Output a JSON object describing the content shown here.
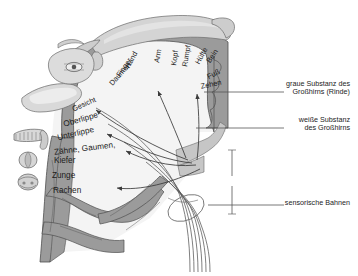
{
  "figure": {
    "language": "de",
    "background": "#ffffff"
  },
  "colors": {
    "gray_matter": "#9b9b9b",
    "gray_matter_dark": "#8a8a8a",
    "white_matter": "#f2f2f2",
    "homunculus_body": "#c9c9c9",
    "homunculus_body_light": "#d8d8d8",
    "outline": "#4a4a4a",
    "arrow": "#3a3a3a",
    "text": "#1c1c1c",
    "leader": "#555555"
  },
  "side_labels": [
    {
      "name": "gray-matter",
      "line1": "graue Substanz des",
      "line2": "Großhirns (Rinde)",
      "text_x": 286,
      "text_y": 86,
      "leader": {
        "x1": 252,
        "y1": 92,
        "x2": 284,
        "y2": 92,
        "tick_x": 204,
        "tick_y": 92
      }
    },
    {
      "name": "white-matter",
      "line1": "weiße Substanz",
      "line2": "des Großhirns",
      "text_x": 286,
      "text_y": 122,
      "leader": {
        "x1": 240,
        "y1": 128,
        "x2": 284,
        "y2": 128,
        "tick_x": 196,
        "tick_y": 128
      }
    },
    {
      "name": "sensory-tracts",
      "line1": "sensorische Bahnen",
      "line2": "",
      "text_x": 286,
      "text_y": 202,
      "leader": {
        "x1": 248,
        "y1": 205,
        "x2": 284,
        "y2": 205,
        "tick_x": 208,
        "tick_y": 205
      }
    }
  ],
  "cortex_labels": [
    {
      "name": "hand",
      "text": "Hand",
      "x": 124,
      "y": 66,
      "rot": -62
    },
    {
      "name": "finger",
      "text": "Finger",
      "x": 115,
      "y": 74,
      "rot": -55
    },
    {
      "name": "daumen",
      "text": "Daumen",
      "x": 108,
      "y": 82,
      "rot": -48
    },
    {
      "name": "gesicht",
      "text": "Gesicht",
      "x": 71,
      "y": 106,
      "rot": -22
    },
    {
      "name": "arm",
      "text": "Arm",
      "x": 153,
      "y": 62,
      "rot": -80
    },
    {
      "name": "kopf",
      "text": "Kopf",
      "x": 170,
      "y": 65,
      "rot": -82
    },
    {
      "name": "rumpf",
      "text": "Rumpf",
      "x": 181,
      "y": 66,
      "rot": -80
    },
    {
      "name": "huefte",
      "text": "Hüfte",
      "x": 194,
      "y": 62,
      "rot": -62
    },
    {
      "name": "bein",
      "text": "Bein",
      "x": 205,
      "y": 60,
      "rot": -55
    },
    {
      "name": "fuss",
      "text": "Fuß",
      "x": 206,
      "y": 74,
      "rot": -28
    },
    {
      "name": "zehen",
      "text": "Zehen",
      "x": 201,
      "y": 83,
      "rot": -12
    }
  ],
  "mouth_labels": [
    {
      "name": "oberlippe",
      "text": "Oberlippe",
      "x": 63,
      "y": 116,
      "rot": -16
    },
    {
      "name": "unterlippe",
      "text": "Unterlippe",
      "x": 58,
      "y": 130,
      "rot": -13
    },
    {
      "name": "zaehne",
      "text": "Zähne, Gaumen,",
      "x": 55,
      "y": 145,
      "rot": -7
    },
    {
      "name": "kiefer",
      "text": "Kiefer",
      "x": 55,
      "y": 156,
      "rot": 0
    },
    {
      "name": "zunge",
      "text": "Zunge",
      "x": 53,
      "y": 171,
      "rot": 0
    },
    {
      "name": "rachen",
      "text": "Rachen",
      "x": 54,
      "y": 186,
      "rot": 0
    }
  ],
  "body_icons": [
    {
      "name": "nose-lips-icon",
      "x": 30,
      "y": 103
    },
    {
      "name": "teeth-jaw-icon",
      "x": 22,
      "y": 140
    },
    {
      "name": "tongue-icon",
      "x": 22,
      "y": 162
    },
    {
      "name": "pharynx-icon",
      "x": 22,
      "y": 182
    }
  ],
  "arrows": [
    {
      "name": "arrow-to-gesicht",
      "path": "M 188 160 C 160 150 120 128 93 109",
      "tip": [
        93,
        109
      ]
    },
    {
      "name": "arrow-to-lippe",
      "path": "M 192 163 C 160 160 124 142 104 133",
      "tip": [
        104,
        133
      ]
    },
    {
      "name": "arrow-to-zaehne",
      "path": "M 196 165 C 168 168 140 158 123 150",
      "tip": [
        123,
        150
      ]
    },
    {
      "name": "arrow-to-rachen",
      "path": "M 200 168 C 172 182 138 190 114 188",
      "tip": [
        114,
        188
      ]
    },
    {
      "name": "arrow-to-arm",
      "path": "M 186 158 C 175 132 164 106 157 89",
      "tip": [
        157,
        89
      ]
    },
    {
      "name": "arrow-to-zehen",
      "path": "M 196 160 C 199 136 199 112 197 92",
      "tip": [
        197,
        92
      ]
    }
  ]
}
